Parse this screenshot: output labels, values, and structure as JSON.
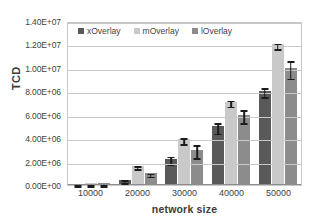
{
  "chart_data": {
    "type": "bar",
    "title": "",
    "xlabel": "network size",
    "ylabel": "TCD",
    "categories": [
      "10000",
      "20000",
      "30000",
      "40000",
      "50000"
    ],
    "ylim": [
      0,
      14000000
    ],
    "ytick_labels": [
      "0.00E+00",
      "2.00E+06",
      "4.00E+06",
      "6.00E+06",
      "8.00E+06",
      "1.00E+07",
      "1.20E+07",
      "1.40E+07"
    ],
    "ytick_values": [
      0,
      2000000,
      4000000,
      6000000,
      8000000,
      10000000,
      12000000,
      14000000
    ],
    "grid": "horizontal",
    "legend_position": "top-left-inside",
    "series": [
      {
        "name": "xOverlay",
        "color": "#595959",
        "values": [
          120000,
          450000,
          2250000,
          5000000,
          8050000
        ],
        "errors": [
          60000,
          120000,
          330000,
          450000,
          400000
        ]
      },
      {
        "name": "mOverlay",
        "color": "#c9c9c9",
        "values": [
          150000,
          1650000,
          3900000,
          7100000,
          12000000
        ],
        "errors": [
          60000,
          120000,
          250000,
          250000,
          250000
        ]
      },
      {
        "name": "lOverlay",
        "color": "#8c8c8c",
        "values": [
          130000,
          1000000,
          3000000,
          6000000,
          10000000
        ],
        "errors": [
          60000,
          120000,
          550000,
          550000,
          750000
        ]
      }
    ]
  }
}
